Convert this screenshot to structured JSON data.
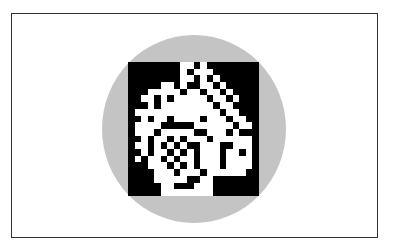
{
  "figure": {
    "colors": {
      "frame_border": "#333333",
      "circle": "#c4c4c4",
      "ink": "#000000",
      "paper": "#ffffff"
    },
    "grid": {
      "cols": 20,
      "rows": 20
    },
    "bitmap": [
      "00000000110100000000",
      "00000000101110000000",
      "00000000110101000000",
      "00000110100110100000",
      "00011111011011010000",
      "00110101111101101000",
      "00010111111110110000",
      "01111111111111011000",
      "00101101111011101100",
      "01111000001111110110",
      "01110111110011101000",
      "00101101011101111110",
      "01101010100111001110",
      "00101101010111011010",
      "01011010110111011110",
      "00011101010111011110",
      "00001110111011111100",
      "00001111100110000000",
      "00000110001110000000",
      "00000111111110000000"
    ]
  }
}
